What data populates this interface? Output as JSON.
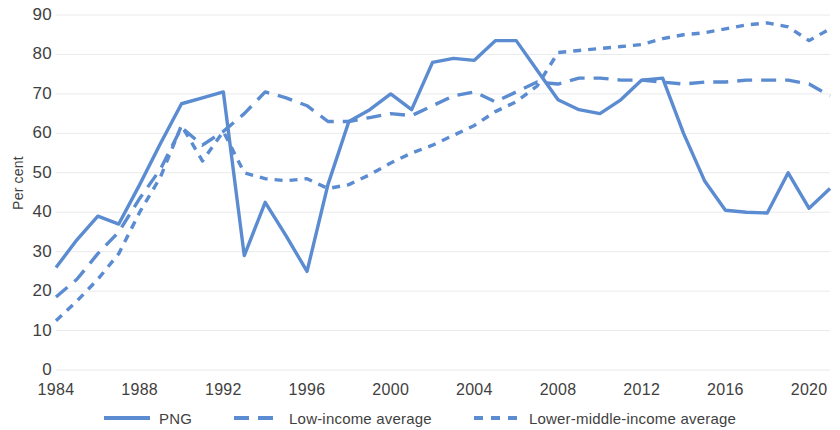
{
  "chart_data": {
    "type": "line",
    "title": "",
    "xlabel": "",
    "ylabel": "Per cent",
    "xlim": [
      1984,
      2021
    ],
    "ylim": [
      0,
      90
    ],
    "grid": true,
    "legend_position": "bottom",
    "accent_color": "#5b8bd0",
    "y_ticks": [
      "0",
      "10",
      "20",
      "30",
      "40",
      "50",
      "60",
      "70",
      "80",
      "90"
    ],
    "x_ticks": [
      "1984",
      "1988",
      "1992",
      "1996",
      "2000",
      "2004",
      "2008",
      "2012",
      "2016",
      "2020"
    ],
    "x": [
      1984,
      1985,
      1986,
      1987,
      1988,
      1989,
      1990,
      1991,
      1992,
      1993,
      1994,
      1995,
      1996,
      1997,
      1998,
      1999,
      2000,
      2001,
      2002,
      2003,
      2004,
      2005,
      2006,
      2007,
      2008,
      2009,
      2010,
      2011,
      2012,
      2013,
      2014,
      2015,
      2016,
      2017,
      2018,
      2019,
      2020,
      2021
    ],
    "series": [
      {
        "name": "PNG",
        "style": "solid",
        "color": "#5b8bd0",
        "values": [
          26,
          33,
          39,
          37,
          47,
          57.5,
          67.5,
          69,
          70.5,
          29,
          42.5,
          34,
          25,
          47,
          63,
          66,
          70,
          66,
          78,
          79,
          78.5,
          83.5,
          83.5,
          76,
          68.5,
          66,
          65,
          68.5,
          73.5,
          74,
          60,
          48,
          40.5,
          40,
          39.8,
          50,
          41,
          46
        ]
      },
      {
        "name": "Low-income average",
        "style": "long-dash",
        "color": "#5b8bd0",
        "values": [
          18.5,
          23,
          29.5,
          35,
          43.5,
          51,
          61.5,
          57,
          60.5,
          65,
          70.5,
          69,
          67,
          63,
          63,
          64,
          65,
          64.5,
          67,
          69.5,
          70.5,
          68,
          70.5,
          73,
          72.5,
          74,
          74,
          73.5,
          73.5,
          73,
          72.5,
          73,
          73,
          73.5,
          73.5,
          73.5,
          72.5,
          69.5
        ]
      },
      {
        "name": "Lower-middle-income average",
        "style": "short-dash",
        "color": "#5b8bd0",
        "values": [
          12.5,
          17.5,
          23,
          29.5,
          40,
          49,
          62,
          53,
          60.5,
          50,
          48.5,
          48,
          48.5,
          46,
          47,
          49.5,
          52.5,
          55,
          57,
          59.5,
          62,
          65.5,
          68,
          72,
          80.5,
          81,
          81.5,
          82,
          82.5,
          84,
          85,
          85.5,
          86.5,
          87.5,
          88,
          87,
          83.5,
          86.5
        ]
      }
    ]
  },
  "legend": [
    {
      "label": "PNG",
      "style": "solid"
    },
    {
      "label": "Low-income average",
      "style": "long-dash"
    },
    {
      "label": "Lower-middle-income average",
      "style": "short-dash"
    }
  ]
}
